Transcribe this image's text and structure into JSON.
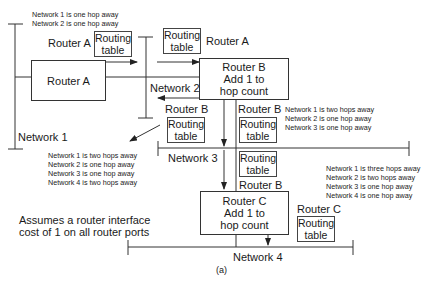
{
  "diagram": {
    "caption": "(a)",
    "note": [
      "Assumes a router interface",
      "cost of 1 on all router ports"
    ],
    "networks": {
      "n1": "Network 1",
      "n2": "Network 2",
      "n3": "Network 3",
      "n4": "Network 4"
    },
    "routers": {
      "a": {
        "lines": [
          "Router A"
        ]
      },
      "b": {
        "lines": [
          "Router B",
          "Add 1 to",
          "hop count"
        ]
      },
      "c": {
        "lines": [
          "Router C",
          "Add 1 to",
          "hop count"
        ]
      }
    },
    "routing_table": [
      "Routing",
      "table"
    ],
    "labels": {
      "router_a": "Router A",
      "router_b": "Router B",
      "router_c": "Router C"
    },
    "tables": {
      "a_out": [
        "Network 1 is one hop away",
        "Network 2 is one hop away"
      ],
      "b_to_n3": [
        "Network 1 is two hops away",
        "Network 2 is one hop away",
        "Network 3 is one hop away"
      ],
      "b_to_n2": [
        "Network 1 is two hops away",
        "Network 2 is one hop away",
        "Network 3 is one hop away",
        "Network 4 is two hops away"
      ],
      "c_to_n4": [
        "Network 1 is three hops away",
        "Network 2 is two hops away",
        "Network 3 is one hop away",
        "Network 4 is one hop away"
      ]
    }
  }
}
